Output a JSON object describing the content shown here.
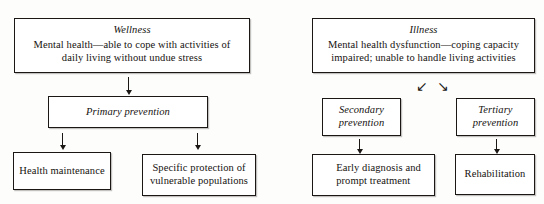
{
  "figure": {
    "columns": [
      "wellness",
      "illness"
    ]
  },
  "wellness_branch": {
    "top": {
      "header": "Wellness",
      "body": "Mental health—able to cope with activities of\ndaily living without undue stress"
    },
    "level": {
      "header": "Primary prevention"
    },
    "outcomes": [
      {
        "label": "Health maintenance"
      },
      {
        "label": "Specific protection of\nvulnerable populations"
      }
    ]
  },
  "illness_branch": {
    "top": {
      "header": "Illness",
      "body": "Mental health dysfunction—coping capacity\nimpaired; unable to handle living activities"
    },
    "levels": [
      {
        "header": "Secondary\nprevention"
      },
      {
        "header": "Tertiary\nprevention"
      }
    ],
    "outcomes": [
      {
        "label": "Early diagnosis and\nprompt treatment"
      },
      {
        "label": "Rehabilitation"
      }
    ]
  },
  "connectors": {
    "wellness_to_primary": "↓",
    "primary_to_health_maintenance": "↓",
    "primary_to_specific_protection": "↓",
    "illness_split_left": "↙",
    "illness_split_right": "↘",
    "secondary_to_early_diagnosis": "↓",
    "tertiary_to_rehabilitation": "↓"
  },
  "colors": {
    "ink": "#1a1714",
    "paper": "#fdfdfc",
    "border": "#1a1714"
  }
}
